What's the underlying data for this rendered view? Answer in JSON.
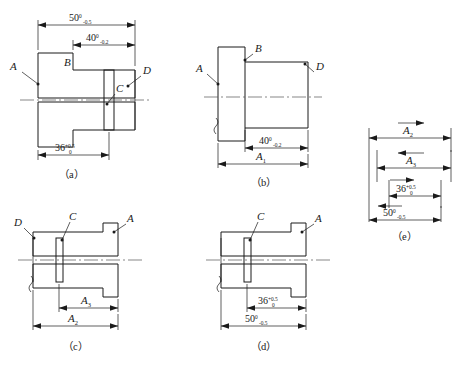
{
  "figure": {
    "line_color": "#1a1a1a",
    "centerline_color": "#555555",
    "background": "#ffffff"
  },
  "captions": {
    "a": "（a）",
    "b": "（b）",
    "c": "（c）",
    "d": "（d）",
    "e": "（e）"
  },
  "view_a": {
    "name": "finished part section view",
    "surface_labels": {
      "A": "A",
      "B": "B",
      "C": "C",
      "D": "D"
    },
    "dimensions": [
      {
        "id": "dim-50",
        "nominal": "50",
        "upper": "0",
        "lower": "-0.5",
        "position": "top-outer"
      },
      {
        "id": "dim-40",
        "nominal": "40",
        "upper": "0",
        "lower": "-0.2",
        "position": "top-inner"
      },
      {
        "id": "dim-36",
        "nominal": "36",
        "upper": "+0.5",
        "lower": "0",
        "position": "bottom"
      }
    ]
  },
  "view_b": {
    "name": "blank / first operation outline view",
    "surface_labels": {
      "A": "A",
      "B": "B",
      "D": "D"
    },
    "dimensions": [
      {
        "id": "dim-40",
        "nominal": "40",
        "upper": "0",
        "lower": "-0.2",
        "position": "lower-inner"
      },
      {
        "id": "dim-A1",
        "nominal": "A",
        "subscript": "1",
        "position": "lower-outer"
      }
    ]
  },
  "view_c": {
    "name": "second operation section view",
    "surface_labels": {
      "A": "A",
      "C": "C",
      "D": "D"
    },
    "dimensions": [
      {
        "id": "dim-A3",
        "nominal": "A",
        "subscript": "3",
        "position": "lower-inner"
      },
      {
        "id": "dim-A2",
        "nominal": "A",
        "subscript": "2",
        "position": "lower-outer"
      }
    ]
  },
  "view_d": {
    "name": "final operation section view",
    "surface_labels": {
      "A": "A",
      "C": "C"
    },
    "dimensions": [
      {
        "id": "dim-36",
        "nominal": "36",
        "upper": "+0.5",
        "lower": "0",
        "position": "lower-inner"
      },
      {
        "id": "dim-50",
        "nominal": "50",
        "upper": "0",
        "lower": "-0.5",
        "position": "lower-outer"
      }
    ]
  },
  "view_e": {
    "name": "dimension chain diagram",
    "links": [
      {
        "id": "link-A2",
        "nominal": "A",
        "subscript": "2",
        "direction": "right",
        "role": "increasing"
      },
      {
        "id": "link-A3",
        "nominal": "A",
        "subscript": "3",
        "direction": "left",
        "role": "decreasing"
      },
      {
        "id": "link-36",
        "nominal": "36",
        "upper": "+0.5",
        "lower": "0",
        "direction": "right",
        "role": "component"
      },
      {
        "id": "link-50",
        "nominal": "50",
        "upper": "0",
        "lower": "-0.5",
        "direction": "left",
        "role": "closing"
      }
    ]
  }
}
